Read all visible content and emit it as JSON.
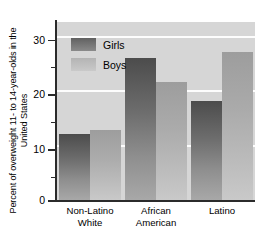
{
  "chart_data": {
    "type": "bar",
    "title": "",
    "xlabel": "",
    "ylabel": "Percent of overweight 11- to 14-year-olds in the United States",
    "categories": [
      "Non-Latino White",
      "African American",
      "Latino"
    ],
    "series": [
      {
        "name": "Girls",
        "values": [
          12.0,
          26.0,
          18.0
        ],
        "color": "#4c4c4c"
      },
      {
        "name": "Boys",
        "values": [
          12.8,
          21.5,
          27.0
        ],
        "color": "#b4b4b4"
      }
    ],
    "ylim": [
      0,
      32.5
    ],
    "yticks": [
      0,
      10,
      20,
      30
    ],
    "yticks_minor": [
      5,
      15,
      25
    ],
    "grid": true,
    "gridlines_at": [
      10,
      20,
      30
    ],
    "legend_position": "upper-left-inside",
    "plot_background": "#d6d6d6"
  },
  "axis": {
    "y_title": "Percent of overweight 11- to 14-year-olds in the United States",
    "tick_labels": [
      "30",
      "20",
      "10",
      "0"
    ]
  },
  "legend": {
    "items": [
      {
        "label": "Girls"
      },
      {
        "label": "Boys"
      }
    ]
  },
  "categories": [
    {
      "line1": "Non-Latino",
      "line2": "White"
    },
    {
      "line1": "African",
      "line2": "American"
    },
    {
      "line1": "Latino",
      "line2": ""
    }
  ]
}
